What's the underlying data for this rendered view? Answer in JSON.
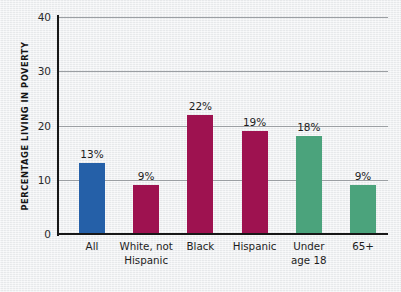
{
  "chart_data": {
    "type": "bar",
    "title": "",
    "subtitle": "",
    "xlabel": "",
    "ylabel": "PERCENTAGE LIVING IN POVERTY",
    "ylim": [
      0,
      40
    ],
    "yticks": [
      0,
      10,
      20,
      30,
      40
    ],
    "ytick_labels": [
      "0",
      "10",
      "20",
      "30",
      "40"
    ],
    "grid": true,
    "legend": "none",
    "categories": [
      "All",
      "White, not Hispanic",
      "Black",
      "Hispanic",
      "Under age 18",
      "65+"
    ],
    "category_lines": [
      [
        "All"
      ],
      [
        "White, not",
        "Hispanic"
      ],
      [
        "Black"
      ],
      [
        "Hispanic"
      ],
      [
        "Under",
        "age 18"
      ],
      [
        "65+"
      ]
    ],
    "values": [
      13,
      9,
      22,
      19,
      18,
      9
    ],
    "data_labels": [
      "13%",
      "9%",
      "22%",
      "19%",
      "18%",
      "9%"
    ],
    "bar_colors": [
      "#2560a8",
      "#9e1250",
      "#9e1250",
      "#9e1250",
      "#4ba37c",
      "#4ba37c"
    ],
    "colors": {
      "blue": "#2560a8",
      "crimson": "#9e1250",
      "green": "#4ba37c",
      "axis": "#171717",
      "gridline": "#9b9fa3",
      "background": "#eceef0",
      "text": "#1d1d1d"
    }
  }
}
